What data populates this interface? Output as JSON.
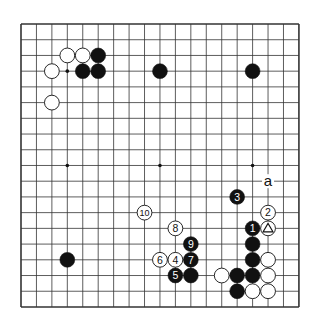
{
  "diagram": {
    "type": "go-board",
    "size": 19,
    "origin": {
      "x": 21,
      "y": 24
    },
    "spacing": {
      "x": 15.44,
      "y": 15.72
    },
    "colors": {
      "background": "#ffffff",
      "line": "#333333",
      "black": "#111111",
      "white": "#ffffff"
    },
    "star_points": [
      [
        3,
        3
      ],
      [
        9,
        3
      ],
      [
        15,
        3
      ],
      [
        3,
        9
      ],
      [
        9,
        9
      ],
      [
        15,
        9
      ],
      [
        3,
        15
      ],
      [
        9,
        15
      ],
      [
        15,
        15
      ]
    ],
    "stones": [
      {
        "color": "white",
        "col": 3,
        "row": 2
      },
      {
        "color": "white",
        "col": 4,
        "row": 2
      },
      {
        "color": "black",
        "col": 5,
        "row": 2
      },
      {
        "color": "white",
        "col": 2,
        "row": 3
      },
      {
        "color": "black",
        "col": 4,
        "row": 3
      },
      {
        "color": "black",
        "col": 5,
        "row": 3
      },
      {
        "color": "white",
        "col": 2,
        "row": 5
      },
      {
        "color": "black",
        "col": 9,
        "row": 3
      },
      {
        "color": "black",
        "col": 15,
        "row": 3
      },
      {
        "color": "black",
        "col": 3,
        "row": 15
      },
      {
        "color": "black",
        "col": 14,
        "row": 11,
        "label": "3"
      },
      {
        "color": "white",
        "col": 16,
        "row": 12,
        "label": "2"
      },
      {
        "color": "black",
        "col": 15,
        "row": 13,
        "label": "1"
      },
      {
        "color": "white",
        "col": 16,
        "row": 13,
        "mark": "triangle"
      },
      {
        "color": "black",
        "col": 15,
        "row": 14
      },
      {
        "color": "black",
        "col": 15,
        "row": 15
      },
      {
        "color": "white",
        "col": 16,
        "row": 15
      },
      {
        "color": "white",
        "col": 13,
        "row": 16
      },
      {
        "color": "black",
        "col": 14,
        "row": 16
      },
      {
        "color": "black",
        "col": 15,
        "row": 16
      },
      {
        "color": "white",
        "col": 16,
        "row": 16
      },
      {
        "color": "black",
        "col": 14,
        "row": 17
      },
      {
        "color": "white",
        "col": 15,
        "row": 17
      },
      {
        "color": "white",
        "col": 16,
        "row": 17
      },
      {
        "color": "white",
        "col": 8,
        "row": 12,
        "label": "10"
      },
      {
        "color": "white",
        "col": 10,
        "row": 13,
        "label": "8"
      },
      {
        "color": "black",
        "col": 11,
        "row": 14,
        "label": "9"
      },
      {
        "color": "white",
        "col": 9,
        "row": 15,
        "label": "6"
      },
      {
        "color": "white",
        "col": 10,
        "row": 15,
        "label": "4"
      },
      {
        "color": "black",
        "col": 11,
        "row": 15,
        "label": "7"
      },
      {
        "color": "black",
        "col": 10,
        "row": 16,
        "label": "5"
      },
      {
        "color": "black",
        "col": 11,
        "row": 16
      }
    ],
    "letters": [
      {
        "text": "a",
        "col": 16,
        "row": 10
      }
    ]
  }
}
